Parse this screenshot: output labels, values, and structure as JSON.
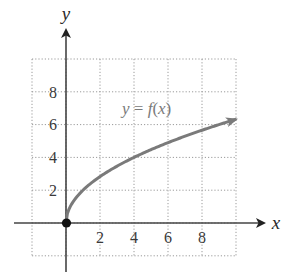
{
  "chart_data": {
    "type": "line",
    "title": "",
    "xlabel": "x",
    "ylabel": "y",
    "xlim": [
      -2,
      10
    ],
    "ylim": [
      -2,
      10
    ],
    "grid": true,
    "grid_style": "dotted",
    "x_ticks": [
      2,
      4,
      6,
      8
    ],
    "y_ticks": [
      2,
      4,
      6,
      8
    ],
    "x_tick_labels": [
      "2",
      "4",
      "6",
      "8"
    ],
    "y_tick_labels": [
      "2",
      "4",
      "6",
      "8"
    ],
    "series": [
      {
        "name": "y = f(x)",
        "function": "f(x) = 2*sqrt(x)",
        "x": [
          0,
          1,
          2,
          3,
          4,
          5,
          6,
          7,
          8,
          9,
          10
        ],
        "y": [
          0,
          2,
          2.83,
          3.46,
          4,
          4.47,
          4.9,
          5.29,
          5.66,
          6,
          6.32
        ],
        "start_point": {
          "x": 0,
          "y": 0,
          "marker": "filled-circle"
        },
        "end": "arrow",
        "color": "#7a7a7a"
      }
    ],
    "annotations": [
      {
        "text": "y = f(x)",
        "x": 5.2,
        "y": 7.1
      }
    ],
    "legend": "none"
  },
  "labels": {
    "x_axis": "x",
    "y_axis": "y",
    "curve_y": "y",
    "curve_eq": " = ",
    "curve_f": "f",
    "curve_paren_open": "(",
    "curve_x": "x",
    "curve_paren_close": ")",
    "xt0": "2",
    "xt1": "4",
    "xt2": "6",
    "xt3": "8",
    "yt0": "2",
    "yt1": "4",
    "yt2": "6",
    "yt3": "8"
  },
  "colors": {
    "axis": "#444444",
    "grid": "#9a9a9a",
    "curve": "#7a7a7a",
    "origin_dot": "#111111"
  }
}
